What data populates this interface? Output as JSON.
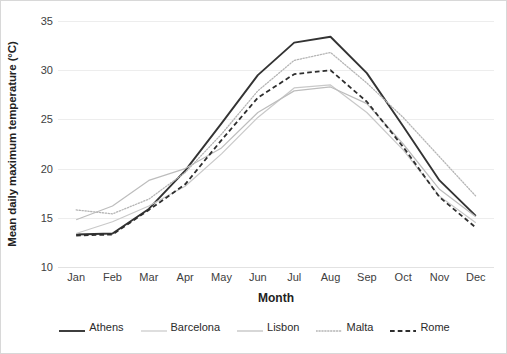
{
  "chart_data": {
    "type": "line",
    "title": "",
    "xlabel": "Month",
    "ylabel": "Mean daily maximum temperature (°C)",
    "categories": [
      "Jan",
      "Feb",
      "Mar",
      "Apr",
      "May",
      "Jun",
      "Jul",
      "Aug",
      "Sep",
      "Oct",
      "Nov",
      "Dec"
    ],
    "x": [
      "Jan",
      "Feb",
      "Mar",
      "Apr",
      "May",
      "Jun",
      "Jul",
      "Aug",
      "Sep",
      "Oct",
      "Nov",
      "Dec"
    ],
    "ylim": [
      10,
      35
    ],
    "yticks": [
      10,
      15,
      20,
      25,
      30,
      35
    ],
    "ytick_labels": [
      "10",
      "15",
      "20",
      "25",
      "30",
      "35"
    ],
    "grid": true,
    "grid_axis": "y",
    "legend_position": "bottom",
    "series": [
      {
        "name": "Athens",
        "style": "solid",
        "color": "#333333",
        "width": 1.9,
        "values": [
          13.3,
          13.4,
          15.9,
          19.8,
          24.6,
          29.5,
          32.8,
          33.4,
          29.7,
          24.3,
          18.8,
          15.2
        ]
      },
      {
        "name": "Barcelona",
        "style": "solid",
        "color": "#c9c9c9",
        "width": 1.2,
        "values": [
          13.4,
          14.6,
          16.2,
          18.2,
          21.5,
          25.2,
          28.2,
          28.5,
          25.7,
          21.9,
          17.2,
          14.5
        ]
      },
      {
        "name": "Lisbon",
        "style": "solid",
        "color": "#bdbdbd",
        "width": 1.2,
        "values": [
          14.8,
          16.2,
          18.8,
          20.0,
          22.1,
          25.7,
          27.9,
          28.3,
          26.6,
          22.5,
          17.9,
          15.1
        ]
      },
      {
        "name": "Malta",
        "style": "dotted",
        "color": "#b5b5b5",
        "width": 1.3,
        "values": [
          15.8,
          15.4,
          16.9,
          19.6,
          23.5,
          27.9,
          31.0,
          31.8,
          28.7,
          25.2,
          21.2,
          17.2
        ]
      },
      {
        "name": "Rome",
        "style": "dashed",
        "color": "#2e2e2e",
        "width": 1.8,
        "values": [
          13.2,
          13.3,
          15.8,
          18.4,
          22.9,
          27.2,
          29.6,
          30.0,
          26.8,
          22.2,
          17.1,
          14.0
        ]
      }
    ]
  },
  "axes": {
    "y_title": "Mean daily maximum temperature (°C)",
    "x_title": "Month"
  },
  "legend": {
    "items": [
      {
        "label": "Athens"
      },
      {
        "label": "Barcelona"
      },
      {
        "label": "Lisbon"
      },
      {
        "label": "Malta"
      },
      {
        "label": "Rome"
      }
    ]
  }
}
